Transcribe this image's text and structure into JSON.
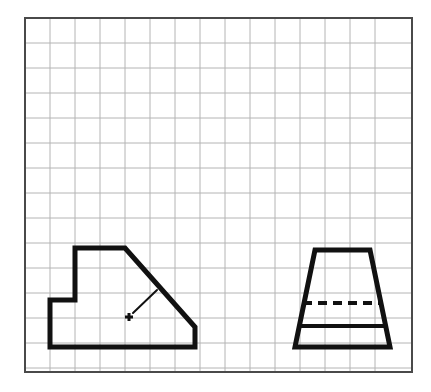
{
  "figure": {
    "background_color": "#ffffff",
    "width": 431,
    "height": 392
  },
  "grid": {
    "name": "square-grid",
    "origin_x": 25,
    "origin_y": 18,
    "right": 412,
    "bottom": 372,
    "cell_size": 25,
    "columns": 15,
    "rows": 14,
    "minor_line_color": "#b4b4b4",
    "minor_line_width": 1,
    "frame_color": "#4a4a4a",
    "frame_line_width": 2
  },
  "drawing": {
    "line_color": "#111111",
    "outline_width": 5,
    "visible_edge_width": 4,
    "hidden_edge_width": 4,
    "hidden_dash_pattern": "9,6",
    "leader_width": 2,
    "center_mark_width": 2
  },
  "views": [
    {
      "id": "front-view",
      "label": "Front view (stepped profile)",
      "type": "polygon",
      "vertices": [
        [
          75,
          248
        ],
        [
          125,
          248
        ],
        [
          195,
          327
        ],
        [
          195,
          347
        ],
        [
          50,
          347
        ],
        [
          50,
          300
        ],
        [
          75,
          300
        ]
      ],
      "closed": true,
      "annotation": {
        "center_mark": {
          "x": 129,
          "y": 317,
          "arm": 4
        },
        "leader": {
          "x1": 133,
          "y1": 313,
          "x2": 157,
          "y2": 290
        }
      }
    },
    {
      "id": "side-view",
      "label": "Side view (trapezoid)",
      "type": "polygon",
      "vertices": [
        [
          315,
          250
        ],
        [
          370,
          250
        ],
        [
          390,
          347
        ],
        [
          295,
          347
        ]
      ],
      "closed": true,
      "internal_edges": [
        {
          "id": "hidden-step-edge",
          "style": "dashed",
          "x1": 303,
          "y1": 303,
          "x2": 382,
          "y2": 303
        },
        {
          "id": "visible-step-edge",
          "style": "solid",
          "x1": 298,
          "y1": 326,
          "x2": 387,
          "y2": 326
        }
      ]
    }
  ],
  "chart_data": {
    "type": "diagram",
    "grid": {
      "spacing": 25,
      "columns": 15,
      "rows": 14,
      "on": true
    },
    "shapes": [
      {
        "name": "front-view",
        "kind": "polygon",
        "points": [
          [
            75,
            248
          ],
          [
            125,
            248
          ],
          [
            195,
            327
          ],
          [
            195,
            347
          ],
          [
            50,
            347
          ],
          [
            50,
            300
          ],
          [
            75,
            300
          ]
        ]
      },
      {
        "name": "side-view",
        "kind": "polygon",
        "points": [
          [
            315,
            250
          ],
          [
            370,
            250
          ],
          [
            390,
            347
          ],
          [
            295,
            347
          ]
        ]
      },
      {
        "name": "hidden-step-edge",
        "kind": "dashed-line",
        "points": [
          [
            303,
            303
          ],
          [
            382,
            303
          ]
        ]
      },
      {
        "name": "visible-step-edge",
        "kind": "solid-line",
        "points": [
          [
            298,
            326
          ],
          [
            387,
            326
          ]
        ]
      },
      {
        "name": "leader-line",
        "kind": "solid-line",
        "points": [
          [
            133,
            313
          ],
          [
            157,
            290
          ]
        ]
      },
      {
        "name": "center-mark",
        "kind": "plus",
        "points": [
          [
            129,
            317
          ]
        ]
      }
    ]
  }
}
